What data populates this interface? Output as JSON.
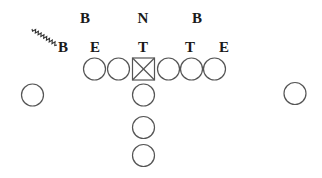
{
  "diagram": {
    "type": "football-play-formation",
    "defense_labels": [
      {
        "id": "def-b-left-outside",
        "text": "B",
        "x": 63,
        "y": 52
      },
      {
        "id": "def-b-left",
        "text": "B",
        "x": 85,
        "y": 23
      },
      {
        "id": "def-e-left",
        "text": "E",
        "x": 95,
        "y": 52
      },
      {
        "id": "def-n",
        "text": "N",
        "x": 143,
        "y": 23
      },
      {
        "id": "def-t-left",
        "text": "T",
        "x": 143,
        "y": 52
      },
      {
        "id": "def-b-right",
        "text": "B",
        "x": 197,
        "y": 23
      },
      {
        "id": "def-t-right",
        "text": "T",
        "x": 190,
        "y": 52
      },
      {
        "id": "def-e-right",
        "text": "E",
        "x": 224,
        "y": 52
      }
    ],
    "offense_players": [
      {
        "id": "split-end-left",
        "shape": "circle",
        "cx": 32.5,
        "cy": 95
      },
      {
        "id": "left-tackle",
        "shape": "circle",
        "cx": 94.5,
        "cy": 69
      },
      {
        "id": "left-guard",
        "shape": "circle",
        "cx": 118.5,
        "cy": 69
      },
      {
        "id": "center",
        "shape": "square-x",
        "cx": 143.5,
        "cy": 69
      },
      {
        "id": "right-guard",
        "shape": "circle",
        "cx": 168.5,
        "cy": 69
      },
      {
        "id": "right-tackle",
        "shape": "circle",
        "cx": 191.5,
        "cy": 69
      },
      {
        "id": "tight-end",
        "shape": "circle",
        "cx": 214.5,
        "cy": 69
      },
      {
        "id": "flanker-right",
        "shape": "circle",
        "cx": 295,
        "cy": 93.5
      },
      {
        "id": "quarterback",
        "shape": "circle",
        "cx": 143.5,
        "cy": 95
      },
      {
        "id": "fullback",
        "shape": "circle",
        "cx": 143.5,
        "cy": 127.5
      },
      {
        "id": "tailback",
        "shape": "circle",
        "cx": 143.5,
        "cy": 155.5
      }
    ],
    "player_radius": 11,
    "motion_line": {
      "from": [
        32,
        29
      ],
      "to": [
        57,
        45
      ],
      "style": "zigzag"
    },
    "colors": {
      "stroke": "#555555",
      "text": "#1a1a1a",
      "background": "#ffffff"
    }
  }
}
